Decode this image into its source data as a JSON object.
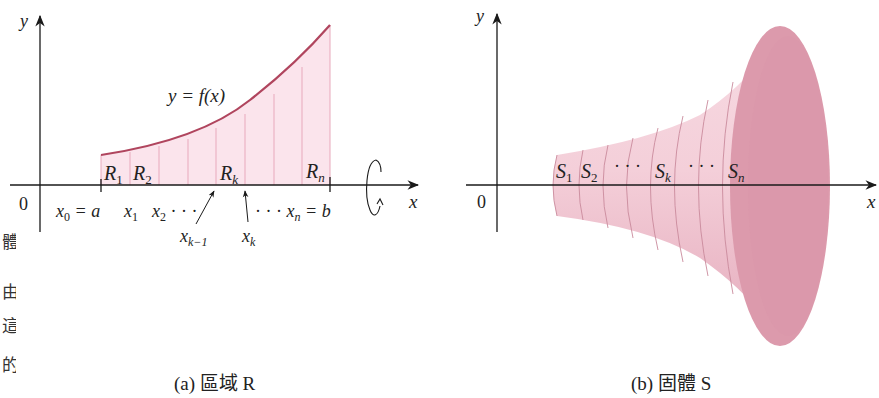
{
  "figure": {
    "left_panel": {
      "caption": "(a) 區域 R",
      "axis_y_label": "y",
      "axis_x_label": "x",
      "origin_label": "0",
      "curve_label": "y = f(x)",
      "region_labels": [
        "R1",
        "R2",
        "Rk",
        "Rn"
      ],
      "region_label_parts": [
        {
          "base": "R",
          "sub": "1"
        },
        {
          "base": "R",
          "sub": "2"
        },
        {
          "base": "R",
          "sub": "k"
        },
        {
          "base": "R",
          "sub": "n"
        }
      ],
      "x_tick_labels": {
        "x0": {
          "base": "x",
          "sub": "0",
          "suffix": " = a"
        },
        "x1": {
          "base": "x",
          "sub": "1"
        },
        "x2": {
          "base": "x",
          "sub": "2",
          "suffix": " · · ·"
        },
        "xk_minus_1": {
          "base": "x",
          "sub": "k−1"
        },
        "xk": {
          "base": "x",
          "sub": "k"
        },
        "xn": {
          "prefix": "· · · ",
          "base": "x",
          "sub": "n",
          "suffix": " = b"
        }
      },
      "rotation_symbol": "rotation-arrow-about-x-axis",
      "colors": {
        "fill": "#fbe4ec",
        "curve": "#b0455e",
        "strip_lines": "#e8a9bc",
        "axis": "#1a1a1a"
      }
    },
    "right_panel": {
      "caption": "(b) 固體 S",
      "axis_y_label": "y",
      "axis_x_label": "x",
      "origin_label": "0",
      "slice_labels": [
        "S1",
        "S2",
        "· · ·",
        "Sk",
        "· · ·",
        "Sn"
      ],
      "slice_label_parts": [
        {
          "base": "S",
          "sub": "1"
        },
        {
          "base": "S",
          "sub": "2"
        },
        {
          "base": "· · ·",
          "sub": ""
        },
        {
          "base": "S",
          "sub": "k"
        },
        {
          "base": "· · ·",
          "sub": ""
        },
        {
          "base": "S",
          "sub": "n"
        }
      ],
      "colors": {
        "body": "#f2c6d2",
        "end_cap": "#dc9aac",
        "slice_lines": "#c98a9c"
      }
    },
    "side_text_fragments": [
      "體",
      "由",
      "這",
      "的"
    ]
  }
}
